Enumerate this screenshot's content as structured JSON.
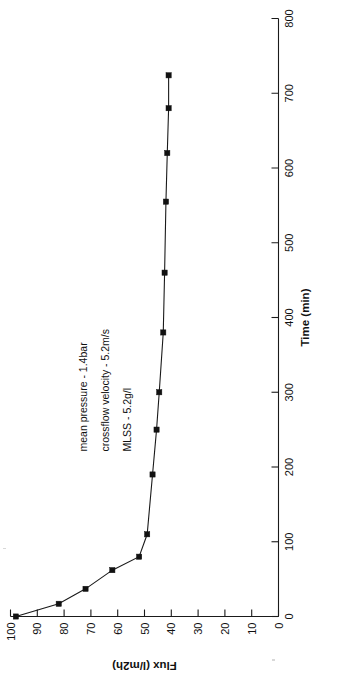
{
  "figure": {
    "background": "#ffffff",
    "ink_color": "#1a1a1a",
    "rotation_note": "chart rendered rotated 90 degrees counter-clockwise"
  },
  "annotations": [
    {
      "id": "mean-pressure",
      "text": "mean pressure - 1.4bar"
    },
    {
      "id": "crossflow-velocity",
      "text": "crossflow velocity - 5.2m/s"
    },
    {
      "id": "mlss",
      "text": "MLSS - 5.2g/l"
    }
  ],
  "chart_data": {
    "type": "line",
    "title": "",
    "xlabel": "Time (min)",
    "ylabel": "Flux (l/m2h)",
    "xlim": [
      0,
      800
    ],
    "ylim": [
      0,
      100
    ],
    "xticks": [
      0,
      100,
      200,
      300,
      400,
      500,
      600,
      700,
      800
    ],
    "xtick_labels": [
      "0",
      "100",
      "200",
      "300",
      "400",
      "500",
      "600",
      "700",
      "800"
    ],
    "yticks": [
      0,
      10,
      20,
      30,
      40,
      50,
      60,
      70,
      80,
      90,
      100
    ],
    "ytick_labels": [
      "0",
      "10",
      "20",
      "30",
      "40",
      "50",
      "60",
      "70",
      "80",
      "90",
      "100"
    ],
    "grid": false,
    "legend": false,
    "marker": "square",
    "series": [
      {
        "name": "Flux",
        "x": [
          0,
          17,
          37,
          62,
          80,
          110,
          190,
          250,
          300,
          380,
          460,
          555,
          620,
          680,
          724
        ],
        "y": [
          98,
          82,
          72,
          62,
          52,
          49,
          47,
          45.5,
          44.5,
          43,
          42.5,
          42,
          41.5,
          41,
          41
        ]
      }
    ]
  }
}
